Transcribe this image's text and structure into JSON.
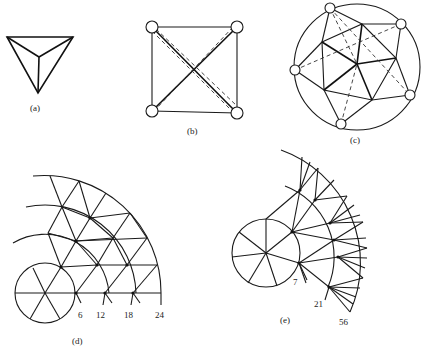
{
  "figure": {
    "panels": [
      {
        "id": "a",
        "caption": "(a)",
        "description": "Tetrahedron viewed from above: triangle with interior vertex connected to three corners"
      },
      {
        "id": "b",
        "caption": "(b)",
        "description": "Square with four circular nodes at corners, solid diagonals and dashed near-diagonals"
      },
      {
        "id": "c",
        "caption": "(c)",
        "description": "Circle enclosing a pentagonal triangulated mesh with six circular boundary nodes and dashed chords"
      },
      {
        "id": "d",
        "caption": "(d)",
        "description": "Quarter-circle graded mesh of concentric arcs around a small circle, with ring node counts",
        "ring_labels": [
          "6",
          "12",
          "18",
          "24"
        ]
      },
      {
        "id": "e",
        "caption": "(e)",
        "description": "Rapidly graded fan mesh around a small circle, with ring node counts",
        "ring_labels": [
          "7",
          "21",
          "56"
        ]
      }
    ]
  }
}
